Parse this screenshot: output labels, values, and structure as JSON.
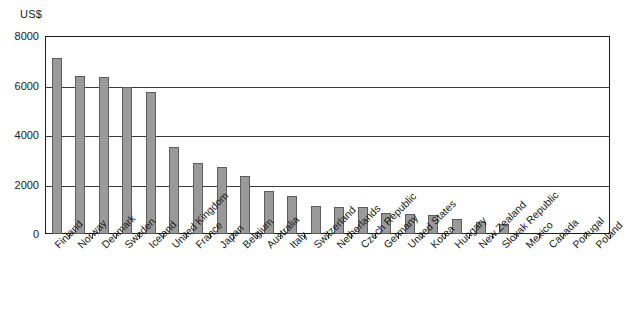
{
  "chart_data": {
    "type": "bar",
    "title": "",
    "subtitle": "",
    "xlabel": "",
    "ylabel": "US$",
    "ylim": [
      0,
      8000
    ],
    "ytick_labels": [
      "0",
      "2000",
      "4000",
      "6000",
      "8000"
    ],
    "ytick_values": [
      0,
      2000,
      4000,
      6000,
      8000
    ],
    "grid": true,
    "legend": "none",
    "bar_color": "#9a9a9a",
    "bar_edge_color": "#5d5d5d",
    "axis_color": "#1f1f1f",
    "categories": [
      "Finland",
      "Norway",
      "Denmark",
      "Sweden",
      "Iceland",
      "United Kingdom",
      "France",
      "Japan",
      "Belgium",
      "Australia",
      "Italy",
      "Switzerland",
      "Netherlands",
      "Czech Republic",
      "Germany",
      "United States",
      "Korea",
      "Hungary",
      "New Zealand",
      "Slovak Republic",
      "Mexico",
      "Canada",
      "Portugal",
      "Poland"
    ],
    "values": [
      7100,
      6400,
      6350,
      5950,
      5750,
      3500,
      2850,
      2700,
      2350,
      1750,
      1550,
      1150,
      1100,
      1100,
      850,
      800,
      750,
      620,
      500,
      420,
      0,
      0,
      0,
      0
    ]
  }
}
